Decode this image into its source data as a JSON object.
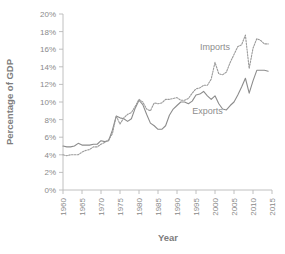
{
  "chart_data": {
    "type": "line",
    "title": "",
    "xlabel": "Year",
    "ylabel": "Percentage of GDP",
    "xlim": [
      1960,
      2015
    ],
    "ylim": [
      0,
      20
    ],
    "grid": false,
    "legend_position": "inline-annotations",
    "x_ticks": [
      "1960",
      "1965",
      "1970",
      "1975",
      "1980",
      "1985",
      "1990",
      "1995",
      "2000",
      "2005",
      "2010",
      "2015"
    ],
    "y_ticks": [
      "0%",
      "2%",
      "4%",
      "6%",
      "8%",
      "10%",
      "12%",
      "14%",
      "16%",
      "18%",
      "20%"
    ],
    "annotations": [
      {
        "text": "Imports",
        "x": 2000,
        "y": 15.9
      },
      {
        "text": "Exports",
        "x": 1998,
        "y": 8.6
      }
    ],
    "x": [
      1960,
      1961,
      1962,
      1963,
      1964,
      1965,
      1966,
      1967,
      1968,
      1969,
      1970,
      1971,
      1972,
      1973,
      1974,
      1975,
      1976,
      1977,
      1978,
      1979,
      1980,
      1981,
      1982,
      1983,
      1984,
      1985,
      1986,
      1987,
      1988,
      1989,
      1990,
      1991,
      1992,
      1993,
      1994,
      1995,
      1996,
      1997,
      1998,
      1999,
      2000,
      2001,
      2002,
      2003,
      2004,
      2005,
      2006,
      2007,
      2008,
      2009,
      2010,
      2011,
      2012,
      2013,
      2014
    ],
    "series": [
      {
        "name": "Exports",
        "style": "solid",
        "color": "#8c8c8c",
        "values": [
          5.0,
          4.9,
          4.9,
          5.0,
          5.3,
          5.1,
          5.1,
          5.1,
          5.2,
          5.2,
          5.6,
          5.5,
          5.6,
          6.8,
          8.4,
          8.2,
          8.1,
          7.8,
          8.1,
          9.3,
          10.2,
          9.7,
          8.6,
          7.6,
          7.3,
          6.9,
          6.9,
          7.3,
          8.5,
          9.2,
          9.6,
          10.0,
          10.0,
          9.8,
          10.1,
          10.8,
          10.9,
          11.2,
          10.7,
          10.3,
          10.7,
          9.8,
          9.2,
          9.1,
          9.6,
          10.0,
          10.8,
          11.7,
          12.7,
          11.0,
          12.4,
          13.6,
          13.6,
          13.6,
          13.5
        ]
      },
      {
        "name": "Imports",
        "style": "dotted",
        "color": "#9a9a9a",
        "values": [
          4.0,
          3.9,
          4.0,
          4.0,
          4.0,
          4.3,
          4.5,
          4.6,
          4.9,
          4.9,
          5.2,
          5.4,
          5.7,
          6.4,
          8.4,
          7.5,
          8.2,
          8.6,
          8.8,
          9.5,
          10.3,
          10.0,
          9.2,
          9.0,
          9.9,
          9.8,
          9.9,
          10.3,
          10.3,
          10.4,
          10.5,
          10.2,
          10.2,
          10.4,
          11.0,
          11.5,
          11.6,
          11.9,
          11.9,
          12.6,
          14.5,
          13.2,
          13.1,
          13.4,
          14.5,
          15.4,
          16.3,
          16.5,
          17.6,
          13.8,
          16.1,
          17.2,
          17.0,
          16.6,
          16.6
        ]
      }
    ]
  }
}
